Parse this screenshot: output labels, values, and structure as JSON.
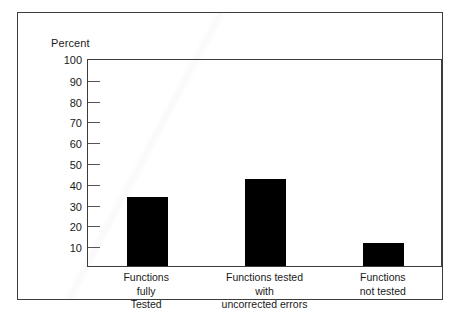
{
  "chart_data": {
    "type": "bar",
    "title": "",
    "xlabel": "",
    "ylabel": "Percent",
    "categories": [
      "Functions\nfully\nTested",
      "Functions tested\nwith\nuncorrected errors",
      "Functions\nnot tested"
    ],
    "values": [
      33,
      42,
      11
    ],
    "ylim": [
      0,
      100
    ],
    "yticks": [
      100,
      90,
      80,
      70,
      60,
      50,
      40,
      30,
      20,
      10
    ],
    "ytick_labels": [
      "100",
      "90",
      "80",
      "70",
      "60",
      "50",
      "40",
      "30",
      "20",
      "10"
    ],
    "grid": false,
    "legend": null,
    "bar_color": "#000000",
    "axis_color": "#3c3c3c",
    "background_color": "#ffffff"
  },
  "figure": {
    "frame_visible": true
  }
}
